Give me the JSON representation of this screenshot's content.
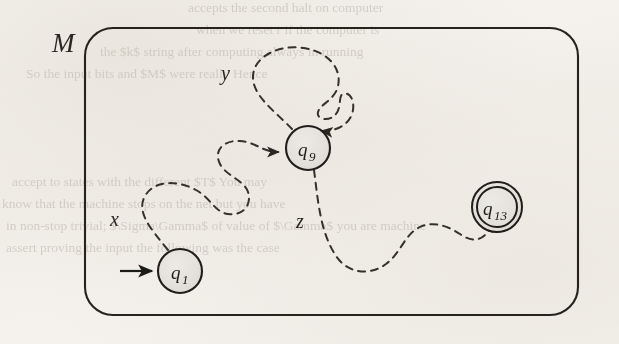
{
  "figure": {
    "machine_label": "M",
    "caption_present": false,
    "states": [
      {
        "id": "q1",
        "label": "q",
        "subscript": "1",
        "type": "start",
        "cx": 180,
        "cy": 271,
        "r": 22,
        "fill": "#e3e0db"
      },
      {
        "id": "q9",
        "label": "q",
        "subscript": "9",
        "type": "normal",
        "cx": 308,
        "cy": 148,
        "r": 22,
        "fill": "#e3e0db"
      },
      {
        "id": "q13",
        "label": "q",
        "subscript": "13",
        "type": "accept",
        "cx": 497,
        "cy": 207,
        "r": 25,
        "fill": "#e3e0db"
      }
    ],
    "transitions": [
      {
        "id": "x",
        "label": "x",
        "from": "q1",
        "to": "q9",
        "style": "dashed",
        "label_x": 118,
        "label_y": 218
      },
      {
        "id": "y",
        "label": "y",
        "from": "q9",
        "to": "q9",
        "style": "dashed",
        "label_x": 228,
        "label_y": 72
      },
      {
        "id": "z",
        "label": "z",
        "from": "q9",
        "to": "q13",
        "style": "dashed",
        "label_x": 303,
        "label_y": 220
      }
    ],
    "start_arrow": {
      "from_x": 120,
      "from_y": 271,
      "to_x": 157,
      "to_y": 271
    },
    "boundary": {
      "x": 85,
      "y": 28,
      "width": 493,
      "height": 287,
      "radius": 28
    },
    "machine_label_x": 52,
    "machine_label_y": 48
  },
  "colors": {
    "ink": "#1d1b19",
    "dashed_ink": "#3a3732",
    "state_fill": "#e3e0db",
    "paper": "#f4f2ee",
    "bleed_text": "#b9b4ab"
  },
  "bleed_lines": [
    {
      "text": "accepts the second halt on computer",
      "x": 188,
      "y": 8,
      "size": 13.5
    },
    {
      "text": "when we reset r if the computer is",
      "x": 196,
      "y": 30,
      "size": 13.5
    },
    {
      "text": "the $k$ string after computing always in running",
      "x": 100,
      "y": 52,
      "size": 13.5
    },
    {
      "text": "So the input bits and $M$ were really  Hence",
      "x": 30,
      "y": 74,
      "size": 13.5
    },
    {
      "text": "accept to states with the different $T$ You may",
      "x": 14,
      "y": 182,
      "size": 13.5
    },
    {
      "text": "know that the machine stops on the net but you have",
      "x": 4,
      "y": 204,
      "size": 13.5
    },
    {
      "text": "in non-stop trivial; $\\Sigma\\Gamma$ of value of $\\Gamma$ you are machine",
      "x": 8,
      "y": 226,
      "size": 13.5
    },
    {
      "text": "assert proving the input the following was the case",
      "x": 8,
      "y": 248,
      "size": 13.5
    }
  ]
}
